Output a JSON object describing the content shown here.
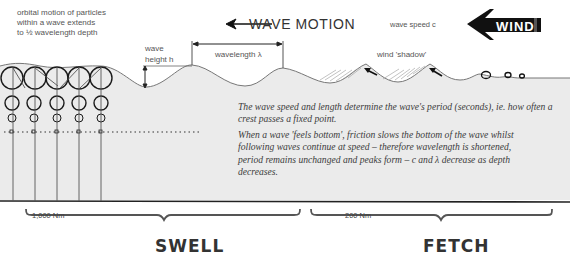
{
  "annotations": {
    "orbital_note": "orbital motion of particles\nwithin a wave extends\nto ½ wavelength depth",
    "wave_motion": "WAVE MOTION",
    "wave_speed": "wave speed c",
    "wave_height": "wave\nheight h",
    "wavelength": "wavelength λ",
    "wind_shadow": "wind 'shadow'",
    "wind_label": "WIND"
  },
  "paragraphs": [
    "The wave speed and length determine the wave's period (seconds), ie. how often a crest passes a fixed point.",
    "When a wave 'feels bottom', friction slows the bottom of the wave whilst following waves continue at speed – therefore wavelength is shortened, period remains unchanged and peaks form – c and λ decrease as depth decreases."
  ],
  "zones": {
    "swell": {
      "distance": "1,000 Nm",
      "label": "SWELL"
    },
    "fetch": {
      "distance": "200 Nm",
      "label": "FETCH"
    }
  },
  "colors": {
    "water": "#ebebeb",
    "line": "#555555",
    "ink": "#222222"
  }
}
